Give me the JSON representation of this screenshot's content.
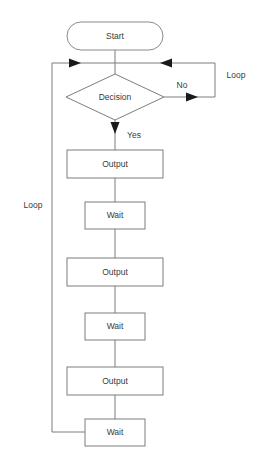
{
  "diagram": {
    "type": "flowchart",
    "canvas": {
      "width": 259,
      "height": 471
    },
    "colors": {
      "background": "#ffffff",
      "stroke": "#7d7d7d",
      "arrow_fill": "#1a1a1a",
      "text": "#3a3a3a"
    },
    "nodes": [
      {
        "id": "start",
        "label": "Start",
        "shape": "terminator",
        "cx": 115,
        "cy": 36,
        "w": 96,
        "h": 28
      },
      {
        "id": "decision",
        "label": "Decision",
        "shape": "diamond",
        "cx": 115,
        "cy": 97,
        "w": 98,
        "h": 46
      },
      {
        "id": "output1",
        "label": "Output",
        "shape": "rect",
        "cx": 115,
        "cy": 164,
        "w": 96,
        "h": 28
      },
      {
        "id": "wait1",
        "label": "Wait",
        "shape": "rect",
        "cx": 115,
        "cy": 215,
        "w": 60,
        "h": 27
      },
      {
        "id": "output2",
        "label": "Output",
        "shape": "rect",
        "cx": 115,
        "cy": 272,
        "w": 96,
        "h": 28
      },
      {
        "id": "wait2",
        "label": "Wait",
        "shape": "rect",
        "cx": 115,
        "cy": 326,
        "w": 60,
        "h": 27
      },
      {
        "id": "output3",
        "label": "Output",
        "shape": "rect",
        "cx": 115,
        "cy": 381,
        "w": 96,
        "h": 28
      },
      {
        "id": "wait3",
        "label": "Wait",
        "shape": "rect",
        "cx": 115,
        "cy": 432,
        "w": 60,
        "h": 27
      }
    ],
    "edge_labels": [
      {
        "id": "label-no",
        "text": "No",
        "x": 182,
        "y": 86
      },
      {
        "id": "label-yes",
        "text": "Yes",
        "x": 134,
        "y": 136
      },
      {
        "id": "label-loop-right",
        "text": "Loop",
        "x": 236,
        "y": 76
      },
      {
        "id": "label-loop-left",
        "text": "Loop",
        "x": 33,
        "y": 206
      }
    ],
    "edges": [
      {
        "id": "start-to-merge",
        "from": "start",
        "to": "merge-point"
      },
      {
        "id": "merge-to-decision",
        "from": "merge-point",
        "to": "decision"
      },
      {
        "id": "decision-no-right",
        "from": "decision",
        "to": "loop-right",
        "label": "No"
      },
      {
        "id": "decision-yes-down",
        "from": "decision",
        "to": "output1",
        "label": "Yes"
      },
      {
        "id": "output1-to-wait1",
        "from": "output1",
        "to": "wait1"
      },
      {
        "id": "wait1-to-output2",
        "from": "wait1",
        "to": "output2"
      },
      {
        "id": "output2-to-wait2",
        "from": "output2",
        "to": "wait2"
      },
      {
        "id": "wait2-to-output3",
        "from": "wait2",
        "to": "output3"
      },
      {
        "id": "output3-to-wait3",
        "from": "output3",
        "to": "wait3"
      },
      {
        "id": "wait3-loop-left",
        "from": "wait3",
        "to": "merge-point",
        "label": "Loop"
      }
    ]
  }
}
